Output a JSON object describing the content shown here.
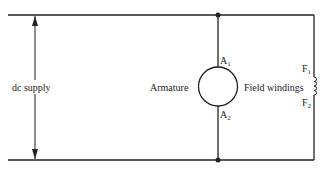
{
  "diagram": {
    "type": "circuit",
    "labels": {
      "supply": "dc supply",
      "armature": "Armature",
      "field": "Field windings",
      "a1_main": "A",
      "a1_sub": "1",
      "a2_main": "A",
      "a2_sub": "2",
      "f1_main": "F",
      "f1_sub": "1",
      "f2_main": "F",
      "f2_sub": "2"
    },
    "components": [
      {
        "name": "dc supply",
        "kind": "voltage-source-arrow"
      },
      {
        "name": "Armature",
        "kind": "circle",
        "terminals": [
          "A1",
          "A2"
        ]
      },
      {
        "name": "Field windings",
        "kind": "coil",
        "terminals": [
          "F1",
          "F2"
        ]
      }
    ],
    "colors": {
      "line": "#222222",
      "background": "#ffffff"
    }
  }
}
